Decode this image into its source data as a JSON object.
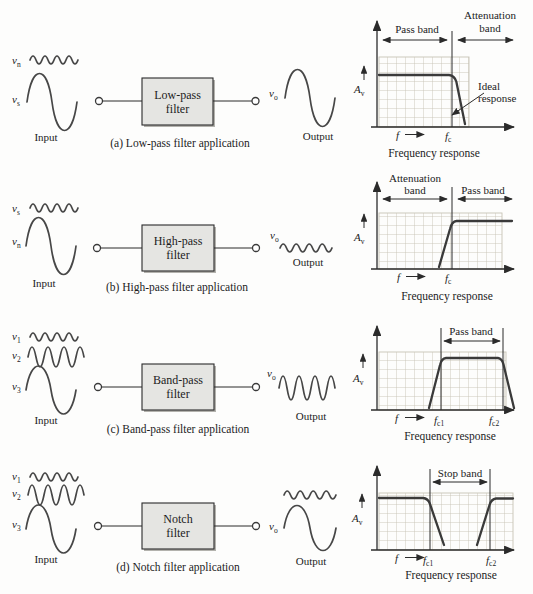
{
  "colors": {
    "ink": "#1c1c1c",
    "curve": "#3a3a3a",
    "wave": "#474747",
    "grid_line": "#c7c3b7",
    "box_fill": "#e5e5e2",
    "box_border": "#2b2b2b"
  },
  "rows": {
    "a": {
      "in1": {
        "base": "v",
        "sub": "n"
      },
      "in2": {
        "base": "v",
        "sub": "s"
      },
      "input_label": "Input",
      "out": {
        "base": "v",
        "sub": "o"
      },
      "output_label": "Output",
      "filter_line1": "Low-pass",
      "filter_line2": "filter",
      "caption": "(a) Low-pass filter application",
      "graph": {
        "left_band": "Pass band",
        "right_band_line1": "Attenuation",
        "right_band_line2": "band",
        "ideal_line1": "Ideal",
        "ideal_line2": "response",
        "gain": {
          "base": "A",
          "sub": "v"
        },
        "freq": "f",
        "fc": {
          "base": "f",
          "sub": "c"
        },
        "caption": "Frequency response"
      }
    },
    "b": {
      "in1": {
        "base": "v",
        "sub": "s"
      },
      "in2": {
        "base": "v",
        "sub": "n"
      },
      "input_label": "Input",
      "out": {
        "base": "v",
        "sub": "o"
      },
      "output_label": "Output",
      "filter_line1": "High-pass",
      "filter_line2": "filter",
      "caption": "(b) High-pass filter application",
      "graph": {
        "left_band_line1": "Attenuation",
        "left_band_line2": "band",
        "right_band": "Pass band",
        "gain": {
          "base": "A",
          "sub": "v"
        },
        "freq": "f",
        "fc": {
          "base": "f",
          "sub": "c"
        },
        "caption": "Frequency response"
      }
    },
    "c": {
      "in1": {
        "base": "v",
        "sub": "1"
      },
      "in2": {
        "base": "v",
        "sub": "2"
      },
      "in3": {
        "base": "v",
        "sub": "3"
      },
      "input_label": "Input",
      "out": {
        "base": "v",
        "sub": "o"
      },
      "output_label": "Output",
      "filter_line1": "Band-pass",
      "filter_line2": "filter",
      "caption": "(c) Band-pass filter application",
      "graph": {
        "band": "Pass band",
        "gain": {
          "base": "A",
          "sub": "v"
        },
        "freq": "f",
        "fc1": {
          "base": "f",
          "sub": "c1"
        },
        "fc2": {
          "base": "f",
          "sub": "c2"
        },
        "caption": "Frequency response"
      }
    },
    "d": {
      "in1": {
        "base": "v",
        "sub": "1"
      },
      "in2": {
        "base": "v",
        "sub": "2"
      },
      "in3": {
        "base": "v",
        "sub": "3"
      },
      "input_label": "Input",
      "out": {
        "base": "v",
        "sub": "o"
      },
      "output_label": "Output",
      "filter_line1": "Notch",
      "filter_line2": "filter",
      "caption": "(d) Notch filter application",
      "graph": {
        "band": "Stop band",
        "gain": {
          "base": "A",
          "sub": "v"
        },
        "freq": "f",
        "fc1": {
          "base": "f",
          "sub": "c1"
        },
        "fc2": {
          "base": "f",
          "sub": "c2"
        },
        "caption": "Frequency response"
      }
    }
  }
}
